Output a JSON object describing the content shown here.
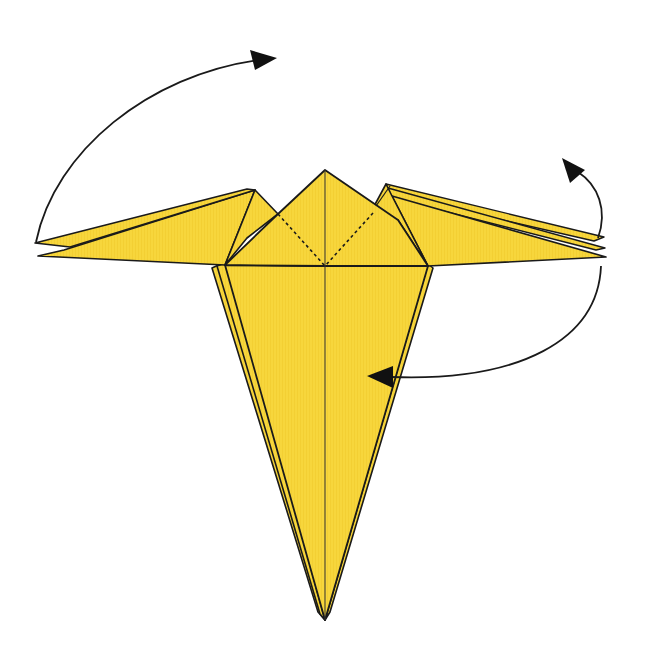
{
  "diagram": {
    "title": "Origami folding step",
    "colors": {
      "paper": "#F7D63C",
      "paper_shadow": "#EEC82E",
      "line": "#1a1a1a",
      "background": "#ffffff"
    },
    "elements": [
      {
        "name": "left-wing",
        "type": "flap",
        "layers": 2
      },
      {
        "name": "right-wing",
        "type": "flap",
        "layers": 3
      },
      {
        "name": "center-kite",
        "type": "flap",
        "dotted_fold_lines": 2
      },
      {
        "name": "body-point",
        "type": "point",
        "layers": 3
      }
    ],
    "arrows": [
      {
        "name": "arrow-left-wing-over",
        "meaning": "fold left wing up and over"
      },
      {
        "name": "arrow-right-wing-up",
        "meaning": "fold right wing layer up"
      },
      {
        "name": "arrow-right-wing-to-body",
        "meaning": "bring right wing layer to center"
      }
    ]
  }
}
